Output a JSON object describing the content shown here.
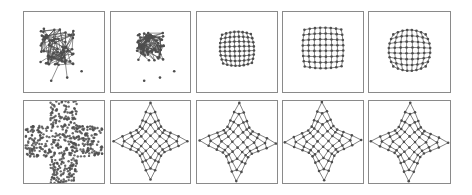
{
  "figure": {
    "width": 472,
    "height": 195,
    "colors": {
      "border": "#8a8a8a",
      "edge": "#4a4a4a",
      "node": "#4d4d4d",
      "background": "#ffffff"
    },
    "rows": [
      {
        "name": "top-row",
        "panels": [
          {
            "id": "t1",
            "x": 23,
            "y": 11,
            "w": 82,
            "h": 82,
            "kind": "tangle",
            "cx": 0.42,
            "cy": 0.44,
            "r": 0.22,
            "seed": 3
          },
          {
            "id": "t2",
            "x": 110,
            "y": 11,
            "w": 81,
            "h": 82,
            "kind": "tangle",
            "cx": 0.5,
            "cy": 0.44,
            "r": 0.17,
            "seed": 7
          },
          {
            "id": "t3",
            "x": 196,
            "y": 11,
            "w": 82,
            "h": 82,
            "kind": "warped-grid",
            "cx": 0.5,
            "cy": 0.46,
            "s": 0.36,
            "bulge": 0.18,
            "twist": 0.25
          },
          {
            "id": "t4",
            "x": 282,
            "y": 11,
            "w": 82,
            "h": 82,
            "kind": "warped-grid",
            "cx": 0.5,
            "cy": 0.45,
            "s": 0.46,
            "bulge": 0.1,
            "twist": 0.05
          },
          {
            "id": "t5",
            "x": 368,
            "y": 11,
            "w": 83,
            "h": 82,
            "kind": "warped-grid",
            "cx": 0.5,
            "cy": 0.48,
            "s": 0.4,
            "bulge": 0.28,
            "twist": 0.0
          }
        ]
      },
      {
        "name": "bottom-row",
        "panels": [
          {
            "id": "b1",
            "x": 23,
            "y": 100,
            "w": 82,
            "h": 84,
            "kind": "cross",
            "seed": 11
          },
          {
            "id": "b2",
            "x": 110,
            "y": 100,
            "w": 81,
            "h": 84,
            "kind": "astroid",
            "cx": 0.5,
            "cy": 0.49,
            "s": 0.44,
            "rot": 0.0
          },
          {
            "id": "b3",
            "x": 196,
            "y": 100,
            "w": 82,
            "h": 84,
            "kind": "astroid",
            "cx": 0.51,
            "cy": 0.5,
            "s": 0.45,
            "rot": 0.04
          },
          {
            "id": "b4",
            "x": 282,
            "y": 100,
            "w": 82,
            "h": 84,
            "kind": "astroid",
            "cx": 0.5,
            "cy": 0.49,
            "s": 0.45,
            "rot": -0.03
          },
          {
            "id": "b5",
            "x": 368,
            "y": 100,
            "w": 83,
            "h": 84,
            "kind": "astroid",
            "cx": 0.5,
            "cy": 0.5,
            "s": 0.45,
            "rot": 0.02
          }
        ]
      }
    ],
    "grid_size": 8
  }
}
